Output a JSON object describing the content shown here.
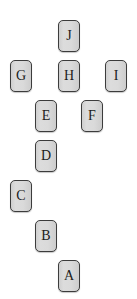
{
  "diagram": {
    "canvas": {
      "width": 137,
      "height": 299,
      "background": "#ffffff"
    },
    "style": {
      "node_fill": "#d6d6d6",
      "node_border": "#3c3c3c",
      "node_text_color": "#1c1c1c",
      "node_width": 22,
      "node_height": 32,
      "corner_radius": 5
    },
    "nodes": [
      {
        "id": "J",
        "label": "J",
        "x": 58,
        "y": 20
      },
      {
        "id": "G",
        "label": "G",
        "x": 10,
        "y": 60
      },
      {
        "id": "H",
        "label": "H",
        "x": 58,
        "y": 60
      },
      {
        "id": "I",
        "label": "I",
        "x": 105,
        "y": 60
      },
      {
        "id": "E",
        "label": "E",
        "x": 35,
        "y": 100
      },
      {
        "id": "F",
        "label": "F",
        "x": 81,
        "y": 100
      },
      {
        "id": "D",
        "label": "D",
        "x": 35,
        "y": 140
      },
      {
        "id": "C",
        "label": "C",
        "x": 10,
        "y": 180
      },
      {
        "id": "B",
        "label": "B",
        "x": 35,
        "y": 220
      },
      {
        "id": "A",
        "label": "A",
        "x": 58,
        "y": 260
      }
    ]
  }
}
